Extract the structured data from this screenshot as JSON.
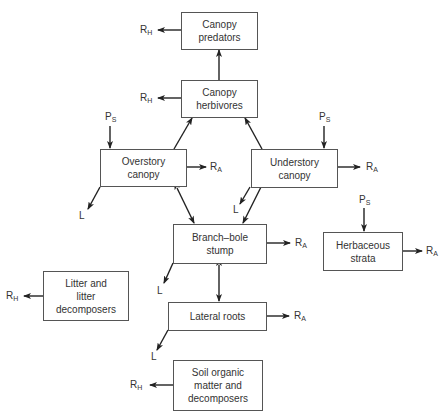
{
  "diagram": {
    "type": "flow",
    "nodes": [
      {
        "id": "canopy_predators",
        "lines": [
          "Canopy",
          "predators"
        ]
      },
      {
        "id": "canopy_herbivores",
        "lines": [
          "Canopy",
          "herbivores"
        ]
      },
      {
        "id": "overstory_canopy",
        "lines": [
          "Overstory",
          "canopy"
        ]
      },
      {
        "id": "understory_canopy",
        "lines": [
          "Understory",
          "canopy"
        ]
      },
      {
        "id": "branch_bole_stump",
        "lines": [
          "Branch–bole",
          "stump"
        ]
      },
      {
        "id": "herbaceous_strata",
        "lines": [
          "Herbaceous",
          "strata"
        ]
      },
      {
        "id": "litter",
        "lines": [
          "Litter and",
          "litter",
          "decomposers"
        ]
      },
      {
        "id": "lateral_roots",
        "lines": [
          "Lateral roots"
        ]
      },
      {
        "id": "soil",
        "lines": [
          "Soil organic",
          "matter and",
          "decomposers"
        ]
      }
    ],
    "symbols": {
      "R_main": "R",
      "H_sub": "H",
      "A_sub": "A",
      "P_main": "P",
      "S_sub": "S",
      "L": "L"
    },
    "edges": [
      {
        "from": "canopy_herbivores",
        "to": "canopy_predators"
      },
      {
        "from": "overstory_canopy",
        "to": "canopy_herbivores"
      },
      {
        "from": "understory_canopy",
        "to": "canopy_herbivores"
      },
      {
        "from": "overstory_canopy",
        "to": "branch_bole_stump",
        "bidirectional": true
      },
      {
        "from": "understory_canopy",
        "to": "branch_bole_stump"
      },
      {
        "from": "branch_bole_stump",
        "to": "lateral_roots",
        "bidirectional": true
      },
      {
        "from": "P_S",
        "to": "overstory_canopy"
      },
      {
        "from": "P_S",
        "to": "understory_canopy"
      },
      {
        "from": "P_S",
        "to": "herbaceous_strata"
      },
      {
        "from": "canopy_predators",
        "to": "R_H"
      },
      {
        "from": "canopy_herbivores",
        "to": "R_H"
      },
      {
        "from": "overstory_canopy",
        "to": "R_A"
      },
      {
        "from": "understory_canopy",
        "to": "R_A"
      },
      {
        "from": "branch_bole_stump",
        "to": "R_A"
      },
      {
        "from": "herbaceous_strata",
        "to": "R_A"
      },
      {
        "from": "lateral_roots",
        "to": "R_A"
      },
      {
        "from": "litter",
        "to": "R_H"
      },
      {
        "from": "soil",
        "to": "R_H"
      },
      {
        "from": "overstory_canopy",
        "to": "L"
      },
      {
        "from": "understory_canopy",
        "to": "L"
      },
      {
        "from": "branch_bole_stump",
        "to": "L"
      },
      {
        "from": "lateral_roots",
        "to": "L"
      }
    ]
  }
}
